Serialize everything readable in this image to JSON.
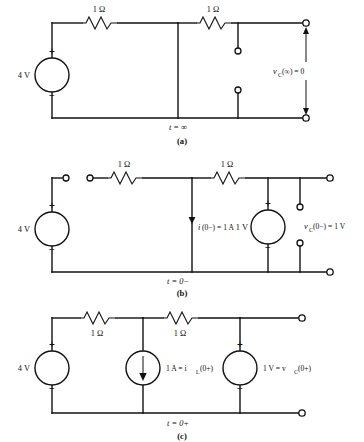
{
  "figure": {
    "panels": [
      {
        "id": "a",
        "caption": "(a)",
        "time_label": "t = ∞",
        "source_label": "4 V",
        "plus_sign": "+",
        "minus_sign": "−",
        "resistor1_label": "1 Ω",
        "resistor2_label": "1 Ω",
        "output_label_main": "v",
        "output_label_sub": "C",
        "output_label_rest": "(∞) = 0"
      },
      {
        "id": "b",
        "caption": "(b)",
        "time_label": "t = 0−",
        "source_label": "4 V",
        "plus_sign": "+",
        "minus_sign": "−",
        "resistor1_label": "1 Ω",
        "resistor2_label": "1 Ω",
        "current_label_main": "i",
        "current_label_rest": "(0−) = 1 A",
        "mid_source_label": "1 V",
        "mid_plus_sign": "+",
        "mid_minus_sign": "−",
        "cap_label_main": "v",
        "cap_label_sub": "C",
        "cap_label_rest": "(0−) = 1 V"
      },
      {
        "id": "c",
        "caption": "(c)",
        "time_label": "t = 0+",
        "source_label": "4 V",
        "plus_sign": "+",
        "minus_sign": "−",
        "resistor1_label": "1 Ω",
        "resistor2_label": "1 Ω",
        "current_source_label_main": "1 A = i",
        "current_source_label_sub": "L",
        "current_source_label_rest": "(0+)",
        "volt_source_label_main": "1 V = v",
        "volt_source_label_sub": "C",
        "volt_source_label_rest": "(0+)",
        "volt_plus_sign": "+",
        "volt_minus_sign": "−"
      }
    ]
  },
  "colors": {
    "ink": "#111111",
    "paper": "#ffffff"
  }
}
